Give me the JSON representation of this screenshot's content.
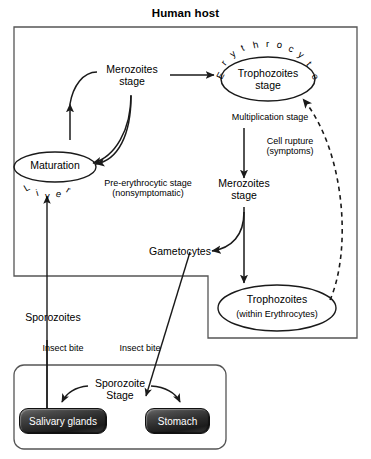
{
  "diagram": {
    "title": "Human host",
    "host_box_label": "Human host",
    "nodes": {
      "merozoites_liver": "Merozoites\nstage",
      "trophozoites_rbc": "Trophozoites\nstage",
      "maturation": "Maturation",
      "merozoites_blood": "Merozoites\nstage",
      "trophozoites_within": "Trophozoites",
      "trophozoites_within_sub": "(within Erythrocytes)",
      "gametocytes": "Gametocytes",
      "sporozoites": "Sporozoites",
      "sporozoite_stage": "Sporozoite\nStage"
    },
    "arc_labels": {
      "erythrocyte": "Erythrocyte",
      "liver": "Liver"
    },
    "annotations": {
      "multiplication_stage": "Multiplication stage",
      "cell_rupture": "Cell rupture\n(symptoms)",
      "pre_erythrocytic": "Pre-erythrocytic stage\n(nonsymptomatic)",
      "insect_bite_left": "Insect bite",
      "insect_bite_right": "Insect bite"
    },
    "organs": {
      "salivary_glands": "Salivary glands",
      "stomach": "Stomach"
    },
    "colors": {
      "stroke": "#1a1a1a",
      "box_stroke": "#555555",
      "text": "#000000",
      "organ_fill": "#2a2a2a",
      "organ_text": "#ffffff",
      "background": "#ffffff"
    }
  }
}
